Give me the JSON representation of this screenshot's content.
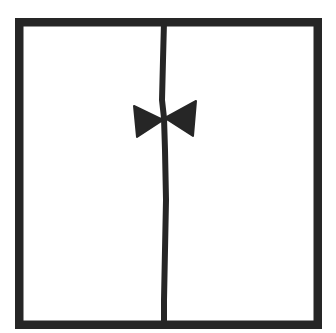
{
  "drawing": {
    "description": "Line drawing of a tuxedo-like shape: square frame split by a vertical line with a bow tie",
    "colors": {
      "background": "#ffffff",
      "ink": "#262626"
    },
    "frame": {
      "x": 15,
      "y": 18,
      "width": 307,
      "height": 311,
      "stroke_width": 8.5
    },
    "center_line": {
      "points": "164,22 163,60 162,100 164,118 165,150 166,200 165,250 164,300 164,325",
      "stroke_width": 6
    },
    "bow_tie": {
      "left_wing": "134,106 137,137 163,120",
      "right_wing": "196,101 193,136 165,118",
      "knot": {
        "cx": 164,
        "cy": 119,
        "r": 3.5
      }
    }
  }
}
